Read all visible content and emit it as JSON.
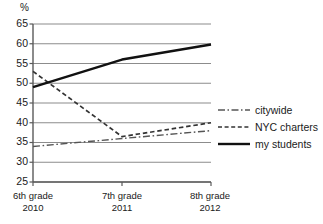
{
  "chart_data": {
    "type": "line",
    "title": "",
    "xlabel": "",
    "ylabel": "%",
    "ylim": [
      25,
      65
    ],
    "ytick_step": 5,
    "yticks": [
      "65",
      "60",
      "55",
      "50",
      "45",
      "40",
      "35",
      "30",
      "25"
    ],
    "grid": true,
    "legend_position": "right",
    "categories": [
      "6th grade\n2010",
      "7th grade\n2011",
      "8th grade\n2012"
    ],
    "x": [
      {
        "grade": "6th grade",
        "year": "2010"
      },
      {
        "grade": "7th grade",
        "year": "2011"
      },
      {
        "grade": "8th grade",
        "year": "2012"
      }
    ],
    "series": [
      {
        "name": "citywide",
        "style": "dash-dot",
        "color": "#555555",
        "values": [
          34,
          36,
          38
        ]
      },
      {
        "name": "NYC charters",
        "style": "dashed",
        "color": "#333333",
        "values": [
          53,
          36.5,
          40
        ]
      },
      {
        "name": "my students",
        "style": "solid",
        "color": "#111111",
        "values": [
          49,
          56,
          59.8
        ]
      }
    ]
  },
  "axis": {
    "y_unit": "%",
    "y_labels": [
      "65",
      "60",
      "55",
      "50",
      "45",
      "40",
      "35",
      "30",
      "25"
    ],
    "x_labels": [
      {
        "line1": "6th grade",
        "line2": "2010"
      },
      {
        "line1": "7th grade",
        "line2": "2011"
      },
      {
        "line1": "8th grade",
        "line2": "2012"
      }
    ]
  },
  "legend": {
    "items": [
      {
        "label": "citywide",
        "style": "dash-dot"
      },
      {
        "label": "NYC charters",
        "style": "dashed"
      },
      {
        "label": "my students",
        "style": "solid"
      }
    ]
  },
  "colors": {
    "grid": "#8c8c8c",
    "axis": "#5a5a5a",
    "citywide": "#555555",
    "charters": "#333333",
    "my_students": "#111111"
  }
}
